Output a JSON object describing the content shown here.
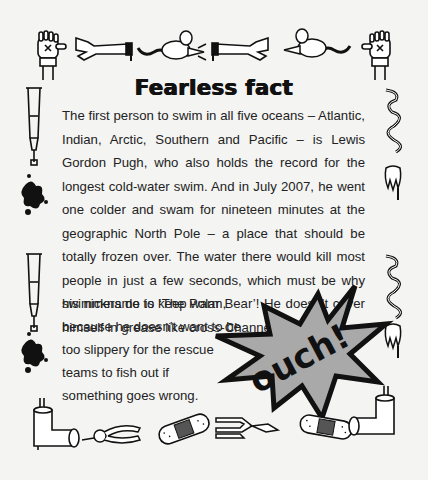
{
  "page": {
    "heading": "Fearless fact",
    "paragraph": "The first person to swim in all five oceans – Atlantic, Indian, Arctic, Southern and Pacific – is Lewis Gordon Pugh, who also holds the record for the longest cold-water swim. And in July 2007, he went one colder and swam for nineteen minutes at the geographic North Pole – a place that should be totally frozen over. The water there would kill most people in just a few seconds, which must be why his nickname is ‘The Polar Bear’! He doesn’t cover himself in grease like cross-Channel",
    "lines_short": [
      "swimmers do to keep  warm,",
      "because he doesn’t want to be",
      "too slippery for the rescue",
      "teams to fish out if",
      "something goes wrong."
    ],
    "burst_text": "ouch!",
    "colors": {
      "background": "#f4f4f2",
      "burst_fill": "#a9a9a9",
      "ink": "#1a1a1a"
    }
  },
  "decorations": {
    "top_border": [
      "glove-hand",
      "severed-hand",
      "rat",
      "severed-hand",
      "rat",
      "glove-hand"
    ],
    "left_border": [
      "crutch",
      "ink-splat",
      "crutch",
      "ink-splat"
    ],
    "right_border": [
      "streamer",
      "tooth",
      "streamer",
      "tooth"
    ],
    "bottom_border": [
      "leg-cast",
      "pliers",
      "bandage",
      "pliers",
      "bandage",
      "leg-cast"
    ]
  }
}
